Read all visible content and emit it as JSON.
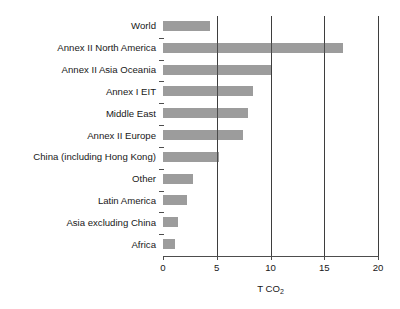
{
  "chart_data": {
    "type": "bar",
    "orientation": "horizontal",
    "title": "",
    "xlabel": "T CO2",
    "xlabel_display": "T CO",
    "xlabel_sub": "2",
    "ylabel": "",
    "xlim": [
      0,
      20
    ],
    "xticks": [
      0,
      5,
      10,
      15,
      20
    ],
    "xtick_labels": [
      "0",
      "5",
      "10",
      "15",
      "20"
    ],
    "grid": "vertical",
    "legend": "none",
    "bar_color": "#9c9c9c",
    "axis_color": "#4d4d4d",
    "categories": [
      "World",
      "Annex II North America",
      "Annex II Asia Oceania",
      "Annex I EIT",
      "Middle East",
      "Annex II Europe",
      "China (including Hong Kong)",
      "Other",
      "Latin America",
      "Asia excluding China",
      "Africa"
    ],
    "values": [
      4.4,
      16.7,
      10.0,
      8.4,
      7.9,
      7.4,
      5.2,
      2.8,
      2.2,
      1.4,
      1.1
    ]
  },
  "header": {
    "clipped_title_fragment": ""
  }
}
